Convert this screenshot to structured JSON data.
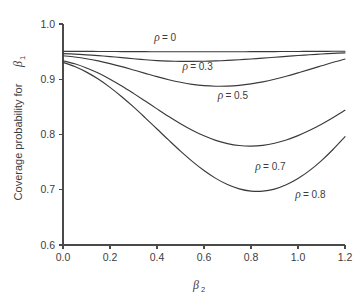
{
  "chart_data": {
    "type": "line",
    "title": "",
    "xlabel": "β₂",
    "ylabel": "Coverage probability for β₁",
    "xlim": [
      0.0,
      1.2
    ],
    "ylim": [
      0.6,
      1.0
    ],
    "grid": false,
    "legend_position": "inline-annotations",
    "xticks": [
      "0.0",
      "0.2",
      "0.4",
      "0.6",
      "0.8",
      "1.0",
      "1.2"
    ],
    "xtick_values": [
      0.0,
      0.2,
      0.4,
      0.6,
      0.8,
      1.0,
      1.2
    ],
    "yticks": [
      "0.6",
      "0.7",
      "0.8",
      "0.9",
      "1.0"
    ],
    "ytick_values": [
      0.6,
      0.7,
      0.8,
      0.9,
      1.0
    ],
    "x": [
      0.0,
      0.05,
      0.1,
      0.15,
      0.2,
      0.25,
      0.3,
      0.35,
      0.4,
      0.45,
      0.5,
      0.55,
      0.6,
      0.65,
      0.7,
      0.75,
      0.8,
      0.85,
      0.9,
      0.95,
      1.0,
      1.05,
      1.1,
      1.15,
      1.2
    ],
    "series": [
      {
        "name": "ρ = 0",
        "rho": 0,
        "label": "ρ = 0",
        "values": [
          0.9505,
          0.9505,
          0.9504,
          0.9503,
          0.9502,
          0.9501,
          0.95,
          0.9499,
          0.9498,
          0.9498,
          0.9497,
          0.9497,
          0.9497,
          0.9497,
          0.9498,
          0.9498,
          0.9499,
          0.95,
          0.9501,
          0.9502,
          0.9503,
          0.9504,
          0.9505,
          0.9506,
          0.9507
        ]
      },
      {
        "name": "ρ = 0.3",
        "rho": 0.3,
        "label": "ρ = 0.3",
        "values": [
          0.9465,
          0.9455,
          0.9442,
          0.9427,
          0.941,
          0.9392,
          0.9372,
          0.9353,
          0.9338,
          0.9329,
          0.9324,
          0.9323,
          0.9326,
          0.9332,
          0.9341,
          0.9353,
          0.9367,
          0.9382,
          0.9398,
          0.9414,
          0.943,
          0.9444,
          0.9457,
          0.9468,
          0.9478
        ]
      },
      {
        "name": "ρ = 0.5",
        "rho": 0.5,
        "label": "ρ = 0.5",
        "values": [
          0.9425,
          0.9403,
          0.9372,
          0.9332,
          0.9283,
          0.9228,
          0.9168,
          0.9107,
          0.9047,
          0.8992,
          0.8945,
          0.8908,
          0.8884,
          0.8874,
          0.8876,
          0.889,
          0.8916,
          0.8953,
          0.9,
          0.9055,
          0.9115,
          0.9178,
          0.9243,
          0.9307,
          0.9366
        ]
      },
      {
        "name": "ρ = 0.7",
        "rho": 0.7,
        "label": "ρ = 0.7",
        "values": [
          0.9335,
          0.928,
          0.9205,
          0.9112,
          0.9002,
          0.8878,
          0.8744,
          0.8605,
          0.8464,
          0.8326,
          0.8196,
          0.8078,
          0.7976,
          0.7894,
          0.7835,
          0.78,
          0.7789,
          0.7803,
          0.7841,
          0.7901,
          0.798,
          0.8076,
          0.8187,
          0.8309,
          0.8439
        ]
      },
      {
        "name": "ρ = 0.8",
        "rho": 0.8,
        "label": "ρ = 0.8",
        "values": [
          0.9305,
          0.9231,
          0.9129,
          0.9003,
          0.8853,
          0.8684,
          0.8499,
          0.8302,
          0.81,
          0.7897,
          0.7699,
          0.7514,
          0.7348,
          0.7206,
          0.7094,
          0.7016,
          0.6976,
          0.6974,
          0.7012,
          0.7089,
          0.7202,
          0.735,
          0.7528,
          0.7733,
          0.796
        ]
      }
    ],
    "annotations": [
      {
        "text": "ρ = 0",
        "x": 0.4,
        "y": 0.969
      },
      {
        "text": "ρ = 0.3",
        "x": 0.52,
        "y": 0.9175
      },
      {
        "text": "ρ = 0.5",
        "x": 0.67,
        "y": 0.864
      },
      {
        "text": "ρ = 0.7",
        "x": 0.83,
        "y": 0.7355
      },
      {
        "text": "ρ = 0.8",
        "x": 1.0,
        "y": 0.685
      }
    ],
    "curve_minima": [
      {
        "series": "ρ = 0",
        "x": 0.55,
        "y": 0.9497
      },
      {
        "series": "ρ = 0.3",
        "x": 0.53,
        "y": 0.9323
      },
      {
        "series": "ρ = 0.5",
        "x": 0.64,
        "y": 0.8874
      },
      {
        "series": "ρ = 0.7",
        "x": 0.79,
        "y": 0.7789
      },
      {
        "series": "ρ = 0.8",
        "x": 0.84,
        "y": 0.6974
      }
    ],
    "colors": {
      "curve": "#3a3a3a",
      "axis": "#4a4a4a",
      "text": "#3c3c3c",
      "background": "#ffffff"
    }
  }
}
